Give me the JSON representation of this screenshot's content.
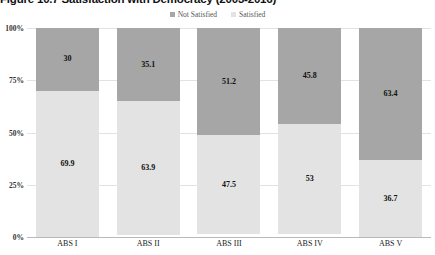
{
  "title": "Figure 10.7 Satisfaction with Democracy (2003-2016)",
  "legend": [
    {
      "label": "Not Satisfied",
      "color": "#a6a6a6",
      "key": "not_satisfied"
    },
    {
      "label": "Satisfied",
      "color": "#e3e3e3",
      "key": "satisfied"
    }
  ],
  "axis": {
    "yticks": [
      "100%",
      "75%",
      "50%",
      "25%",
      "0%"
    ],
    "ytick_values": [
      100,
      75,
      50,
      25,
      0
    ]
  },
  "chart_data": {
    "type": "bar",
    "subtype": "stacked-vertical",
    "title": "Figure 10.7 Satisfaction with Democracy (2003-2016)",
    "xlabel": "",
    "ylabel": "",
    "ylim": [
      0,
      100
    ],
    "yticks": [
      0,
      25,
      50,
      75,
      100
    ],
    "ytick_labels": [
      "0%",
      "25%",
      "50%",
      "75%",
      "100%"
    ],
    "grid": true,
    "legend_position": "top-center",
    "stack_order_top_to_bottom": [
      "Not Satisfied",
      "Satisfied"
    ],
    "categories": [
      "ABS I",
      "ABS II",
      "ABS III",
      "ABS IV",
      "ABS V"
    ],
    "series": [
      {
        "name": "Not Satisfied",
        "color": "#a6a6a6",
        "values": [
          30,
          35.1,
          51.2,
          45.8,
          63.4
        ],
        "labels": [
          "30",
          "35.1",
          "51.2",
          "45.8",
          "63.4"
        ]
      },
      {
        "name": "Satisfied",
        "color": "#e3e3e3",
        "values": [
          69.9,
          63.9,
          47.5,
          53,
          36.7
        ],
        "labels": [
          "69.9",
          "63.9",
          "47.5",
          "53",
          "36.7"
        ]
      }
    ]
  }
}
